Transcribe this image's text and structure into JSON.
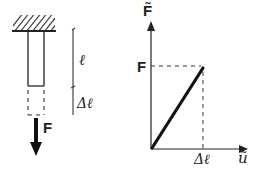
{
  "left_figure": {
    "force_label": "F",
    "length_label": "ℓ",
    "elongation_label": "Δℓ"
  },
  "right_figure": {
    "y_axis_label": "F̃",
    "x_axis_label": "ũ",
    "y_tick_label": "F",
    "x_tick_label": "Δℓ"
  },
  "colors": {
    "ink": "#222222",
    "background": "#ffffff"
  }
}
